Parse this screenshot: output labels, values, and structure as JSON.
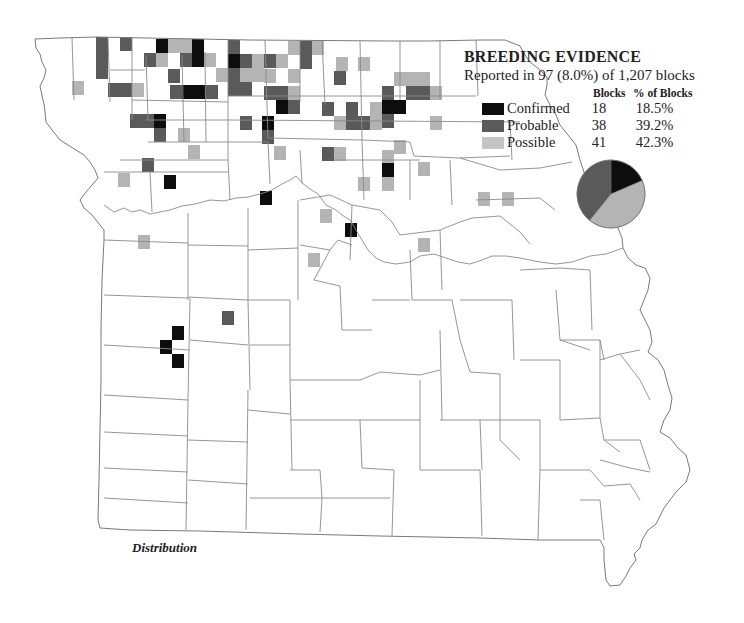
{
  "legend": {
    "title": "BREEDING EVIDENCE",
    "subtitle": "Reported in 97 (8.0%) of 1,207 blocks",
    "col_blocks": "Blocks",
    "col_pct": "% of Blocks",
    "rows": [
      {
        "label": "Confirmed",
        "blocks": "18",
        "pct": "18.5%",
        "color": "#0d0d0d"
      },
      {
        "label": "Probable",
        "blocks": "38",
        "pct": "39.2%",
        "color": "#5a5a5a"
      },
      {
        "label": "Possible",
        "blocks": "41",
        "pct": "42.3%",
        "color": "#b4b4b4"
      }
    ]
  },
  "caption": "Distribution",
  "chart_data": {
    "type": "pie",
    "title": "BREEDING EVIDENCE",
    "subtitle": "Reported in 97 (8.0%) of 1,207 blocks",
    "categories": [
      "Confirmed",
      "Probable",
      "Possible"
    ],
    "values": [
      18,
      38,
      41
    ],
    "percentages": [
      18.5,
      39.2,
      42.3
    ],
    "colors": [
      "#0d0d0d",
      "#5a5a5a",
      "#b4b4b4"
    ],
    "total_blocks": 1207,
    "reported_blocks": 97
  },
  "blocks": [
    {
      "x": 96,
      "y": 37,
      "w": 12,
      "h": 42,
      "c": "#5a5a5a"
    },
    {
      "x": 120,
      "y": 37,
      "w": 12,
      "h": 14,
      "c": "#5a5a5a"
    },
    {
      "x": 156,
      "y": 39,
      "w": 12,
      "h": 14,
      "c": "#0d0d0d"
    },
    {
      "x": 168,
      "y": 39,
      "w": 24,
      "h": 14,
      "c": "#b4b4b4"
    },
    {
      "x": 192,
      "y": 39,
      "w": 12,
      "h": 28,
      "c": "#0d0d0d"
    },
    {
      "x": 144,
      "y": 53,
      "w": 12,
      "h": 14,
      "c": "#5a5a5a"
    },
    {
      "x": 156,
      "y": 53,
      "w": 12,
      "h": 14,
      "c": "#b4b4b4"
    },
    {
      "x": 180,
      "y": 53,
      "w": 12,
      "h": 14,
      "c": "#5a5a5a"
    },
    {
      "x": 204,
      "y": 53,
      "w": 12,
      "h": 14,
      "c": "#b4b4b4"
    },
    {
      "x": 228,
      "y": 40,
      "w": 12,
      "h": 14,
      "c": "#5a5a5a"
    },
    {
      "x": 228,
      "y": 54,
      "w": 12,
      "h": 14,
      "c": "#0d0d0d"
    },
    {
      "x": 240,
      "y": 54,
      "w": 12,
      "h": 14,
      "c": "#5a5a5a"
    },
    {
      "x": 252,
      "y": 54,
      "w": 12,
      "h": 14,
      "c": "#b4b4b4"
    },
    {
      "x": 264,
      "y": 54,
      "w": 12,
      "h": 14,
      "c": "#5a5a5a"
    },
    {
      "x": 276,
      "y": 54,
      "w": 12,
      "h": 14,
      "c": "#b4b4b4"
    },
    {
      "x": 288,
      "y": 41,
      "w": 12,
      "h": 14,
      "c": "#b4b4b4"
    },
    {
      "x": 300,
      "y": 41,
      "w": 12,
      "h": 28,
      "c": "#5a5a5a"
    },
    {
      "x": 312,
      "y": 41,
      "w": 12,
      "h": 14,
      "c": "#b4b4b4"
    },
    {
      "x": 168,
      "y": 69,
      "w": 12,
      "h": 14,
      "c": "#5a5a5a"
    },
    {
      "x": 216,
      "y": 68,
      "w": 12,
      "h": 14,
      "c": "#b4b4b4"
    },
    {
      "x": 228,
      "y": 68,
      "w": 12,
      "h": 28,
      "c": "#5a5a5a"
    },
    {
      "x": 240,
      "y": 68,
      "w": 12,
      "h": 14,
      "c": "#b4b4b4"
    },
    {
      "x": 252,
      "y": 68,
      "w": 12,
      "h": 14,
      "c": "#b4b4b4"
    },
    {
      "x": 240,
      "y": 82,
      "w": 12,
      "h": 14,
      "c": "#5a5a5a"
    },
    {
      "x": 264,
      "y": 69,
      "w": 12,
      "h": 14,
      "c": "#b4b4b4"
    },
    {
      "x": 288,
      "y": 69,
      "w": 12,
      "h": 14,
      "c": "#b4b4b4"
    },
    {
      "x": 72,
      "y": 81,
      "w": 12,
      "h": 14,
      "c": "#b4b4b4"
    },
    {
      "x": 108,
      "y": 83,
      "w": 24,
      "h": 14,
      "c": "#5a5a5a"
    },
    {
      "x": 132,
      "y": 83,
      "w": 12,
      "h": 14,
      "c": "#b4b4b4"
    },
    {
      "x": 170,
      "y": 85,
      "w": 12,
      "h": 14,
      "c": "#5a5a5a"
    },
    {
      "x": 182,
      "y": 85,
      "w": 24,
      "h": 14,
      "c": "#0d0d0d"
    },
    {
      "x": 206,
      "y": 85,
      "w": 12,
      "h": 14,
      "c": "#5a5a5a"
    },
    {
      "x": 264,
      "y": 86,
      "w": 24,
      "h": 14,
      "c": "#5a5a5a"
    },
    {
      "x": 288,
      "y": 86,
      "w": 12,
      "h": 14,
      "c": "#b4b4b4"
    },
    {
      "x": 336,
      "y": 57,
      "w": 12,
      "h": 14,
      "c": "#b4b4b4"
    },
    {
      "x": 358,
      "y": 57,
      "w": 12,
      "h": 14,
      "c": "#b4b4b4"
    },
    {
      "x": 334,
      "y": 71,
      "w": 12,
      "h": 14,
      "c": "#5a5a5a"
    },
    {
      "x": 394,
      "y": 72,
      "w": 36,
      "h": 14,
      "c": "#b4b4b4"
    },
    {
      "x": 382,
      "y": 86,
      "w": 12,
      "h": 14,
      "c": "#5a5a5a"
    },
    {
      "x": 406,
      "y": 86,
      "w": 24,
      "h": 14,
      "c": "#5a5a5a"
    },
    {
      "x": 430,
      "y": 86,
      "w": 12,
      "h": 14,
      "c": "#b4b4b4"
    },
    {
      "x": 276,
      "y": 100,
      "w": 12,
      "h": 14,
      "c": "#0d0d0d"
    },
    {
      "x": 288,
      "y": 100,
      "w": 12,
      "h": 14,
      "c": "#5a5a5a"
    },
    {
      "x": 322,
      "y": 102,
      "w": 12,
      "h": 14,
      "c": "#5a5a5a"
    },
    {
      "x": 346,
      "y": 102,
      "w": 12,
      "h": 14,
      "c": "#5a5a5a"
    },
    {
      "x": 370,
      "y": 102,
      "w": 12,
      "h": 14,
      "c": "#b4b4b4"
    },
    {
      "x": 382,
      "y": 100,
      "w": 24,
      "h": 14,
      "c": "#0d0d0d"
    },
    {
      "x": 346,
      "y": 116,
      "w": 24,
      "h": 14,
      "c": "#5a5a5a"
    },
    {
      "x": 334,
      "y": 116,
      "w": 12,
      "h": 14,
      "c": "#b4b4b4"
    },
    {
      "x": 370,
      "y": 116,
      "w": 12,
      "h": 14,
      "c": "#b4b4b4"
    },
    {
      "x": 382,
      "y": 114,
      "w": 12,
      "h": 14,
      "c": "#5a5a5a"
    },
    {
      "x": 430,
      "y": 116,
      "w": 12,
      "h": 14,
      "c": "#b4b4b4"
    },
    {
      "x": 240,
      "y": 116,
      "w": 12,
      "h": 14,
      "c": "#5a5a5a"
    },
    {
      "x": 130,
      "y": 114,
      "w": 24,
      "h": 14,
      "c": "#5a5a5a"
    },
    {
      "x": 154,
      "y": 114,
      "w": 12,
      "h": 14,
      "c": "#0d0d0d"
    },
    {
      "x": 154,
      "y": 128,
      "w": 12,
      "h": 14,
      "c": "#5a5a5a"
    },
    {
      "x": 178,
      "y": 128,
      "w": 12,
      "h": 14,
      "c": "#b4b4b4"
    },
    {
      "x": 262,
      "y": 116,
      "w": 12,
      "h": 14,
      "c": "#0d0d0d"
    },
    {
      "x": 262,
      "y": 130,
      "w": 12,
      "h": 14,
      "c": "#5a5a5a"
    },
    {
      "x": 274,
      "y": 146,
      "w": 12,
      "h": 14,
      "c": "#b4b4b4"
    },
    {
      "x": 394,
      "y": 140,
      "w": 12,
      "h": 14,
      "c": "#b4b4b4"
    },
    {
      "x": 188,
      "y": 145,
      "w": 12,
      "h": 14,
      "c": "#b4b4b4"
    },
    {
      "x": 322,
      "y": 147,
      "w": 12,
      "h": 14,
      "c": "#5a5a5a"
    },
    {
      "x": 334,
      "y": 147,
      "w": 12,
      "h": 14,
      "c": "#b4b4b4"
    },
    {
      "x": 142,
      "y": 158,
      "w": 12,
      "h": 14,
      "c": "#5a5a5a"
    },
    {
      "x": 382,
      "y": 150,
      "w": 12,
      "h": 14,
      "c": "#b4b4b4"
    },
    {
      "x": 382,
      "y": 163,
      "w": 12,
      "h": 14,
      "c": "#0d0d0d"
    },
    {
      "x": 418,
      "y": 162,
      "w": 12,
      "h": 14,
      "c": "#b4b4b4"
    },
    {
      "x": 118,
      "y": 173,
      "w": 12,
      "h": 14,
      "c": "#b4b4b4"
    },
    {
      "x": 164,
      "y": 175,
      "w": 12,
      "h": 14,
      "c": "#0d0d0d"
    },
    {
      "x": 358,
      "y": 177,
      "w": 12,
      "h": 14,
      "c": "#b4b4b4"
    },
    {
      "x": 382,
      "y": 177,
      "w": 12,
      "h": 14,
      "c": "#b4b4b4"
    },
    {
      "x": 260,
      "y": 191,
      "w": 12,
      "h": 14,
      "c": "#0d0d0d"
    },
    {
      "x": 478,
      "y": 192,
      "w": 12,
      "h": 14,
      "c": "#b4b4b4"
    },
    {
      "x": 502,
      "y": 192,
      "w": 12,
      "h": 14,
      "c": "#b4b4b4"
    },
    {
      "x": 320,
      "y": 209,
      "w": 12,
      "h": 14,
      "c": "#b4b4b4"
    },
    {
      "x": 345,
      "y": 223,
      "w": 12,
      "h": 14,
      "c": "#0d0d0d"
    },
    {
      "x": 138,
      "y": 235,
      "w": 12,
      "h": 14,
      "c": "#b4b4b4"
    },
    {
      "x": 418,
      "y": 238,
      "w": 12,
      "h": 14,
      "c": "#b4b4b4"
    },
    {
      "x": 308,
      "y": 253,
      "w": 12,
      "h": 14,
      "c": "#b4b4b4"
    },
    {
      "x": 222,
      "y": 311,
      "w": 12,
      "h": 14,
      "c": "#5a5a5a"
    },
    {
      "x": 172,
      "y": 326,
      "w": 12,
      "h": 14,
      "c": "#0d0d0d"
    },
    {
      "x": 160,
      "y": 340,
      "w": 12,
      "h": 14,
      "c": "#0d0d0d"
    },
    {
      "x": 172,
      "y": 354,
      "w": 12,
      "h": 14,
      "c": "#0d0d0d"
    }
  ]
}
